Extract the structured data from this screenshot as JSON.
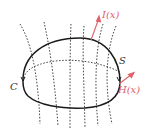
{
  "diagram": {
    "labels": {
      "surface": "S",
      "boundary": "C",
      "vector_i": "I(x)",
      "vector_h": "H(x)"
    },
    "colors": {
      "curve": "#1a1a1a",
      "field_lines": "#333333",
      "vectors": "#e0606a",
      "label_dark": "#333333"
    }
  }
}
